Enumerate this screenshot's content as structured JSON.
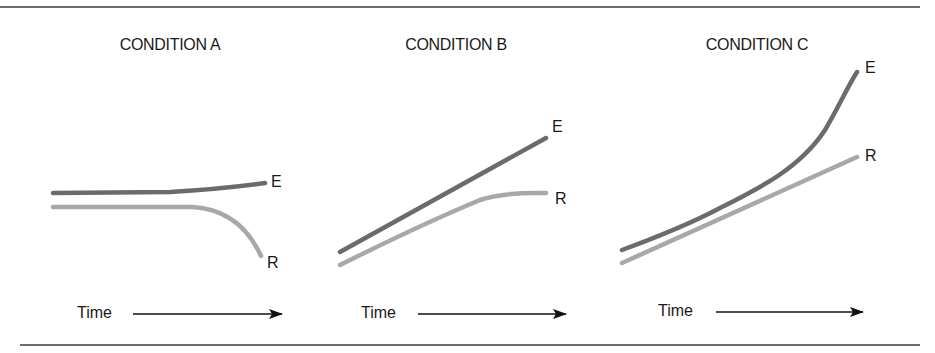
{
  "figure": {
    "panels": [
      {
        "title": "CONDITION A",
        "e_label": "E",
        "r_label": "R",
        "time_label": "Time",
        "description": "E stays roughly flat, rising slightly; R flat then falls sharply"
      },
      {
        "title": "CONDITION B",
        "e_label": "E",
        "r_label": "R",
        "time_label": "Time",
        "description": "E rises linearly; R rises then levels off"
      },
      {
        "title": "CONDITION C",
        "e_label": "E",
        "r_label": "R",
        "time_label": "Time",
        "description": "E rises exponentially; R rises linearly"
      }
    ],
    "colors": {
      "e_line": "#6b6b6b",
      "r_line": "#a8a8a8",
      "text": "#1a1a1a",
      "rule": "#6e6e6e"
    }
  }
}
